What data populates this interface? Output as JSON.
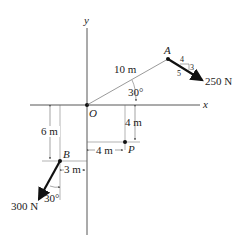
{
  "diagram": {
    "axes": {
      "x_label": "x",
      "y_label": "y",
      "origin_label": "O"
    },
    "point_A": {
      "label": "A",
      "distance_label": "10 m",
      "angle_label": "30°",
      "force": {
        "label": "250 N",
        "slope_run": "4",
        "slope_rise": "3",
        "slope_hyp": "5"
      }
    },
    "point_P": {
      "label": "P",
      "dx_label": "4 m",
      "dy_label": "4 m"
    },
    "point_B": {
      "label": "B",
      "dy_label": "6 m",
      "dx_label": "3 m",
      "angle_label": "30°",
      "force": {
        "label": "300 N"
      }
    },
    "colors": {
      "line": "#333333",
      "thin": "#555555"
    }
  }
}
